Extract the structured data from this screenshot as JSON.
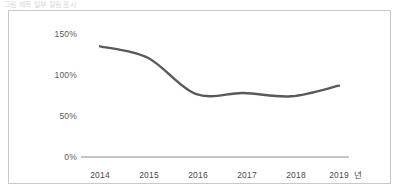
{
  "page": {
    "title_strip": "그림 제목 일부 잘림 표시"
  },
  "chart_data": {
    "type": "line",
    "title": "",
    "xlabel": "년",
    "ylabel": "",
    "categories": [
      "2014",
      "2015",
      "2016",
      "2017",
      "2018",
      "2019"
    ],
    "x": [
      2014,
      2015,
      2016,
      2017,
      2018,
      2019
    ],
    "values": [
      135,
      121,
      77,
      78,
      74,
      87
    ],
    "series": [
      {
        "name": "",
        "values": [
          135,
          121,
          77,
          78,
          74,
          87
        ]
      }
    ],
    "ylim": [
      0,
      150
    ],
    "yticks": [
      0,
      50,
      100,
      150
    ],
    "ytick_labels": [
      "0%",
      "50%",
      "100%",
      "150%"
    ],
    "xtick_labels": [
      "2014",
      "2015",
      "2016",
      "2017",
      "2018",
      "2019"
    ],
    "grid": false,
    "legend": null,
    "line_color": "#595959",
    "line_width": 2.4,
    "smoothing": "spline",
    "axis_color": "#8c8c8c",
    "frame_color": "#c9c9c9",
    "background": "#ffffff",
    "unit_suffix": "년",
    "annotations": []
  },
  "colors": {
    "line": "#595959",
    "axis": "#8c8c8c",
    "frame": "#c9c9c9",
    "tick_text": "#4a4a4a",
    "background": "#ffffff"
  }
}
